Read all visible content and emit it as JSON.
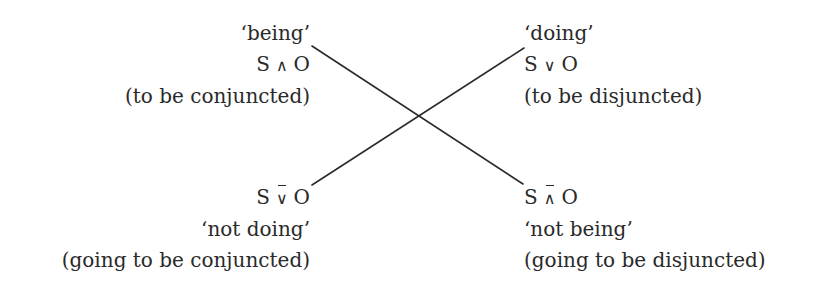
{
  "diagram": {
    "nodes": {
      "top_left": {
        "label": "‘being’",
        "formula": {
          "subject": "S",
          "operator": "∧",
          "object": "O",
          "negated": false
        },
        "gloss": "(to be conjuncted)"
      },
      "top_right": {
        "label": "‘doing’",
        "formula": {
          "subject": "S",
          "operator": "∨",
          "object": "O",
          "negated": false
        },
        "gloss": "(to be disjuncted)"
      },
      "bottom_left": {
        "label": "‘not doing’",
        "formula": {
          "subject": "S",
          "operator": "∨",
          "object": "O",
          "negated": true
        },
        "gloss": "(going to be conjuncted)"
      },
      "bottom_right": {
        "label": "‘not being’",
        "formula": {
          "subject": "S",
          "operator": "∧",
          "object": "O",
          "negated": true
        },
        "gloss": "(going to be disjuncted)"
      }
    },
    "edges": [
      {
        "from": "top_left",
        "to": "bottom_right",
        "x1": 312,
        "y1": 46,
        "x2": 523,
        "y2": 184
      },
      {
        "from": "top_right",
        "to": "bottom_left",
        "x1": 524,
        "y1": 48,
        "x2": 312,
        "y2": 185
      }
    ],
    "colors": {
      "line": "#2a2a2a",
      "text": "#2a2a2a",
      "background": "#ffffff"
    }
  }
}
